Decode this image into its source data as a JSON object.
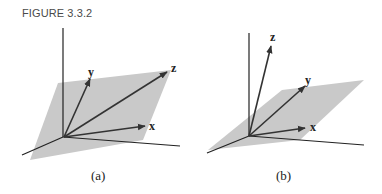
{
  "figure": {
    "title": "FIGURE 3.3.2",
    "panels": [
      {
        "caption": "(a)",
        "vectors": [
          {
            "label": "y"
          },
          {
            "label": "z"
          },
          {
            "label": "x"
          }
        ],
        "description": "Vectors x, y, z all lying in a shaded plane"
      },
      {
        "caption": "(b)",
        "vectors": [
          {
            "label": "z"
          },
          {
            "label": "y"
          },
          {
            "label": "x"
          }
        ],
        "description": "Vectors x and y in a shaded plane, z out of the plane"
      }
    ],
    "colors": {
      "plane": "#c8c8c8",
      "axis": "#222222",
      "vector": "#333333"
    }
  }
}
